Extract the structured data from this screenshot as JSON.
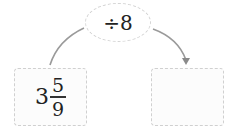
{
  "operation": {
    "label": "÷8",
    "operator": "÷",
    "operand": "8"
  },
  "input": {
    "whole": "3",
    "numerator": "5",
    "denominator": "9"
  },
  "output": {
    "value": ""
  },
  "colors": {
    "arrow": "#9a9a9a",
    "dashed_border": "#d0d0d0"
  }
}
